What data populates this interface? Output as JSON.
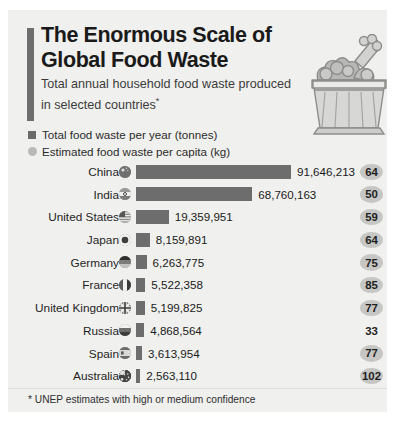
{
  "header": {
    "title_line1": "The Enormous Scale of",
    "title_line2": "Global Food Waste",
    "subtitle": "Total annual household food waste produced in selected countries",
    "subtitle_marker": "*",
    "accent_color": "#6e6e6e",
    "illustration": "overflowing-trash-bin-with-food-waste"
  },
  "legend": {
    "items": [
      {
        "marker": "square",
        "color": "#6b6b6b",
        "label": "Total food waste per year (tonnes)"
      },
      {
        "marker": "circle",
        "color": "#b9b9b9",
        "label": "Estimated food waste per capita (kg)"
      }
    ]
  },
  "footnote": "* UNEP estimates with high or medium confidence",
  "chart_data": {
    "type": "bar",
    "title": "The Enormous Scale of Global Food Waste",
    "subtitle": "Total annual household food waste produced in selected countries*",
    "orientation": "horizontal",
    "xlabel": "",
    "ylabel": "",
    "grid": false,
    "legend_position": "top-left",
    "xlim": [
      0,
      91646213
    ],
    "bar_color": "#6d6d6d",
    "categories": [
      "China",
      "India",
      "United States",
      "Japan",
      "Germany",
      "France",
      "United Kingdom",
      "Russia",
      "Spain",
      "Australia"
    ],
    "series": [
      {
        "name": "Total food waste per year (tonnes)",
        "values": [
          91646213,
          68760163,
          19359951,
          8159891,
          6263775,
          5522358,
          5199825,
          4868564,
          3613954,
          2563110
        ],
        "labels": [
          "91,646,213",
          "68,760,163",
          "19,359,951",
          "8,159,891",
          "6,263,775",
          "5,522,358",
          "5,199,825",
          "4,868,564",
          "3,613,954",
          "2,563,110"
        ]
      },
      {
        "name": "Estimated food waste per capita (kg)",
        "values": [
          64,
          50,
          59,
          64,
          75,
          85,
          77,
          33,
          77,
          102
        ],
        "labels": [
          "64",
          "50",
          "59",
          "64",
          "75",
          "85",
          "77",
          "33",
          "77",
          "102"
        ]
      }
    ],
    "rows": [
      {
        "country": "China",
        "flag": "flag-china",
        "total_label": "91,646,213",
        "total": 91646213,
        "capita": "64",
        "badge": true
      },
      {
        "country": "India",
        "flag": "flag-india",
        "total_label": "68,760,163",
        "total": 68760163,
        "capita": "50",
        "badge": true
      },
      {
        "country": "United States",
        "flag": "flag-united-states",
        "total_label": "19,359,951",
        "total": 19359951,
        "capita": "59",
        "badge": true
      },
      {
        "country": "Japan",
        "flag": "flag-japan",
        "total_label": "8,159,891",
        "total": 8159891,
        "capita": "64",
        "badge": true
      },
      {
        "country": "Germany",
        "flag": "flag-germany",
        "total_label": "6,263,775",
        "total": 6263775,
        "capita": "75",
        "badge": true
      },
      {
        "country": "France",
        "flag": "flag-france",
        "total_label": "5,522,358",
        "total": 5522358,
        "capita": "85",
        "badge": true
      },
      {
        "country": "United Kingdom",
        "flag": "flag-united-kingdom",
        "total_label": "5,199,825",
        "total": 5199825,
        "capita": "77",
        "badge": true
      },
      {
        "country": "Russia",
        "flag": "flag-russia",
        "total_label": "4,868,564",
        "total": 4868564,
        "capita": "33",
        "badge": false
      },
      {
        "country": "Spain",
        "flag": "flag-spain",
        "total_label": "3,613,954",
        "total": 3613954,
        "capita": "77",
        "badge": true
      },
      {
        "country": "Australia",
        "flag": "flag-australia",
        "total_label": "2,563,110",
        "total": 2563110,
        "capita": "102",
        "badge": true
      }
    ]
  }
}
